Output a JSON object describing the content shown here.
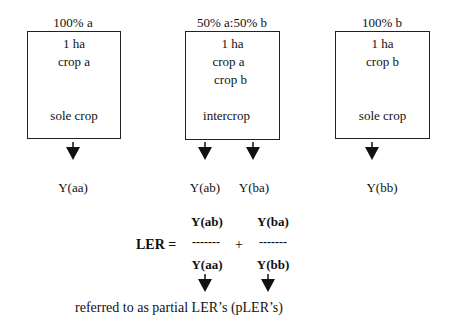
{
  "diagram": {
    "systems": [
      {
        "proportion_label": "100% a",
        "area": "1 ha",
        "crops": [
          "crop a"
        ],
        "type_label": "sole crop",
        "yields": [
          "Y(aa)"
        ]
      },
      {
        "proportion_label": "50% a:50% b",
        "area": "1 ha",
        "crops": [
          "crop a",
          "crop b"
        ],
        "type_label": "intercrop",
        "yields": [
          "Y(ab)",
          "Y(ba)"
        ]
      },
      {
        "proportion_label": "100% b",
        "area": "1 ha",
        "crops": [
          "crop b"
        ],
        "type_label": "sole crop",
        "yields": [
          "Y(bb)"
        ]
      }
    ],
    "formula": {
      "label": "LER =",
      "plus": "+",
      "terms": [
        {
          "numerator": "Y(ab)",
          "divider": "-------",
          "denominator": "Y(aa)"
        },
        {
          "numerator": "Y(ba)",
          "divider": "-------",
          "denominator": "Y(bb)"
        }
      ]
    },
    "caption": "referred to as partial LER’s (pLER’s)",
    "colors": {
      "line": "#222222",
      "text": "#111111",
      "background": "#ffffff"
    }
  }
}
